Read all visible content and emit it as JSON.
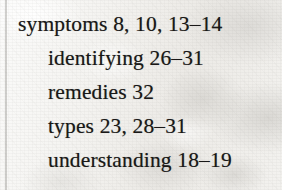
{
  "page": {
    "kind": "scanned-book-index-fragment",
    "paper_color": "#f2f1ee",
    "ink_color": "#191817",
    "gutter_rule_color": "#6c6a65"
  },
  "index_entry": {
    "headword": "symptoms",
    "lines": [
      {
        "text": "symptoms 8, 10, 13–14",
        "term": "symptoms",
        "locators": "8, 10, 13–14",
        "level": 0
      },
      {
        "text": "identifying 26–31",
        "term": "identifying",
        "locators": "26–31",
        "level": 1
      },
      {
        "text": "remedies 32",
        "term": "remedies",
        "locators": "32",
        "level": 1
      },
      {
        "text": "types 23, 28–31",
        "term": "types",
        "locators": "23, 28–31",
        "level": 1
      },
      {
        "text": "understanding 18–19",
        "term": "understanding",
        "locators": "18–19",
        "level": 1
      }
    ]
  }
}
